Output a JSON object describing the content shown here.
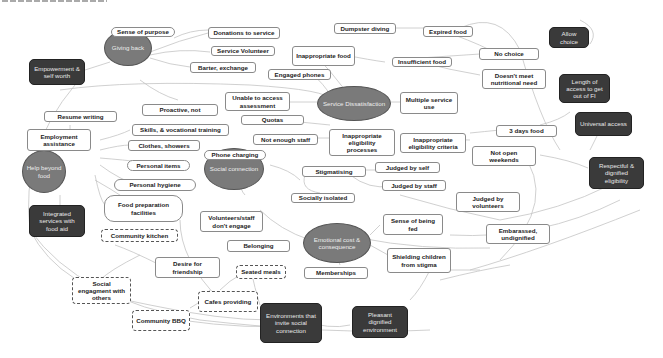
{
  "diagram": {
    "type": "concept-map",
    "clipped_header_text_visible": true,
    "colors": {
      "theme_oval": "#7a7a7a",
      "outcome_box": "#3a3a3a",
      "box_border": "#8a8a8a",
      "edge": "#bdbdbd"
    },
    "themes": [
      {
        "id": "giving_back",
        "label": "Giving back"
      },
      {
        "id": "service_dissatisfaction",
        "label": "Service Dissatisfaction"
      },
      {
        "id": "help_beyond_food",
        "label": "Help beyond food"
      },
      {
        "id": "social_connection",
        "label": "Social connection"
      },
      {
        "id": "emotional_cost",
        "label": "Emotional cost & consequence"
      }
    ],
    "outcomes": [
      {
        "id": "empowerment",
        "label": "Empowerment & self worth"
      },
      {
        "id": "allow_choice",
        "label": "Allow choice"
      },
      {
        "id": "length_access",
        "label": "Length of access to get out of FI"
      },
      {
        "id": "universal_access",
        "label": "Universal access"
      },
      {
        "id": "respectful",
        "label": "Respectful & dignified eligibility"
      },
      {
        "id": "integrated",
        "label": "Integrated services with food aid"
      },
      {
        "id": "environments",
        "label": "Environments that invite social connection"
      },
      {
        "id": "pleasant",
        "label": "Pleasant dignified environment"
      }
    ],
    "concepts": [
      {
        "id": "sense_purpose",
        "label": "Sense of purpose",
        "style": "pill"
      },
      {
        "id": "donations",
        "label": "Donations to service",
        "style": "box"
      },
      {
        "id": "service_volunteer",
        "label": "Service Volunteer",
        "style": "box"
      },
      {
        "id": "barter",
        "label": "Barter, exchange",
        "style": "box"
      },
      {
        "id": "proactive",
        "label": "Proactive, not",
        "style": "box"
      },
      {
        "id": "dumpster",
        "label": "Dumpster diving",
        "style": "box"
      },
      {
        "id": "expired",
        "label": "Expired food",
        "style": "box"
      },
      {
        "id": "inappropriate_food",
        "label": "Inappropriate food",
        "style": "box"
      },
      {
        "id": "insufficient",
        "label": "Insufficient food",
        "style": "box"
      },
      {
        "id": "no_choice",
        "label": "No choice",
        "style": "box"
      },
      {
        "id": "engaged_phones",
        "label": "Engaged phones",
        "style": "box"
      },
      {
        "id": "nutritional",
        "label": "Doesn't meet nutritional need",
        "style": "box"
      },
      {
        "id": "unable_assess",
        "label": "Unable to access assessment",
        "style": "box"
      },
      {
        "id": "multiple_use",
        "label": "Multiple service use",
        "style": "box"
      },
      {
        "id": "quotas",
        "label": "Quotas",
        "style": "box"
      },
      {
        "id": "resume",
        "label": "Resume writing",
        "style": "box"
      },
      {
        "id": "employment",
        "label": "Employment assistance",
        "style": "box"
      },
      {
        "id": "skills",
        "label": "Skills, & vocational training",
        "style": "box"
      },
      {
        "id": "clothes",
        "label": "Clothes, showers",
        "style": "box"
      },
      {
        "id": "not_enough_staff",
        "label": "Not enough staff",
        "style": "box"
      },
      {
        "id": "inapp_processes",
        "label": "Inappropriate eligibility processes",
        "style": "box"
      },
      {
        "id": "inapp_criteria",
        "label": "Inappropriate eligibility criteria",
        "style": "box"
      },
      {
        "id": "three_days",
        "label": "3 days food",
        "style": "box"
      },
      {
        "id": "not_open",
        "label": "Not open weekends",
        "style": "box"
      },
      {
        "id": "personal_items",
        "label": "Personal items",
        "style": "pill"
      },
      {
        "id": "phone_charging",
        "label": "Phone charging",
        "style": "pill"
      },
      {
        "id": "personal_hygiene",
        "label": "Personal hygiene",
        "style": "pill"
      },
      {
        "id": "food_prep",
        "label": "Food preparation facilities",
        "style": "pill"
      },
      {
        "id": "stigmatising",
        "label": "Stigmatising",
        "style": "box"
      },
      {
        "id": "judged_self",
        "label": "Judged by self",
        "style": "box"
      },
      {
        "id": "judged_staff",
        "label": "Judged by staff",
        "style": "box"
      },
      {
        "id": "socially_isolated",
        "label": "Socially isolated",
        "style": "box"
      },
      {
        "id": "judged_volunteers",
        "label": "Judged by volunteers",
        "style": "box"
      },
      {
        "id": "community_kitchen",
        "label": "Community kitchen",
        "style": "dashed"
      },
      {
        "id": "vol_dont_engage",
        "label": "Volunteers/staff don't engage",
        "style": "box"
      },
      {
        "id": "sense_fed",
        "label": "Sense of being fed",
        "style": "box"
      },
      {
        "id": "embarrassed",
        "label": "Embarassed, undignified",
        "style": "box"
      },
      {
        "id": "belonging",
        "label": "Belonging",
        "style": "box"
      },
      {
        "id": "shielding",
        "label": "Shielding children from stigma",
        "style": "box"
      },
      {
        "id": "desire_friend",
        "label": "Desire for friendship",
        "style": "box"
      },
      {
        "id": "seated_meals",
        "label": "Seated meals",
        "style": "dashed"
      },
      {
        "id": "memberships",
        "label": "Memberships",
        "style": "box"
      },
      {
        "id": "social_engagement",
        "label": "Social engagment with others",
        "style": "dashed"
      },
      {
        "id": "cafes",
        "label": "Cafes providing",
        "style": "dashed"
      },
      {
        "id": "community_bbq",
        "label": "Community BBQ",
        "style": "dashed"
      }
    ]
  }
}
